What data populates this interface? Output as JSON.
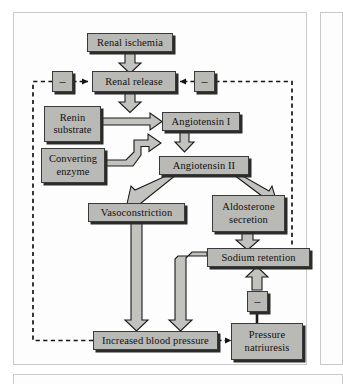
{
  "figure": {
    "type": "flowchart",
    "colors": {
      "box_fill": "#b9b9b5",
      "box_border": "#3a3a3a",
      "box_shadow": "#2b2b2b",
      "arrow_fill": "#c2c2be",
      "arrow_outline": "#1b1b1b",
      "dashed_line": "#141414",
      "panel_border": "#c9c9c9",
      "page_background": "#ffffff"
    }
  },
  "nodes": [
    {
      "id": "renal_ischemia",
      "label": "Renal ischemia"
    },
    {
      "id": "minus_left",
      "label": "–"
    },
    {
      "id": "renal_release",
      "label": "Renal release"
    },
    {
      "id": "minus_right",
      "label": "–"
    },
    {
      "id": "renin_substrate",
      "label_line1": "Renin",
      "label_line2": "substrate"
    },
    {
      "id": "angiotensin_i",
      "label": "Angiotensin I"
    },
    {
      "id": "converting_enzyme",
      "label_line1": "Converting",
      "label_line2": "enzyme"
    },
    {
      "id": "angiotensin_ii",
      "label": "Angiotensin II"
    },
    {
      "id": "vasoconstriction",
      "label": "Vasoconstriction"
    },
    {
      "id": "aldosterone",
      "label_line1": "Aldosterone",
      "label_line2": "secretion"
    },
    {
      "id": "sodium_retention",
      "label": "Sodium retention"
    },
    {
      "id": "minus_bottom",
      "label": "–"
    },
    {
      "id": "increased_bp",
      "label": "Increased blood pressure"
    },
    {
      "id": "pressure_natriuresis",
      "label_line1": "Pressure",
      "label_line2": "natriuresis"
    }
  ],
  "edges": [
    {
      "from": "renal_ischemia",
      "to": "renal_release",
      "style": "block-arrow"
    },
    {
      "from": "minus_left",
      "to": "renal_release",
      "style": "dashed-arrow"
    },
    {
      "from": "minus_right",
      "to": "renal_release",
      "style": "dashed-arrow"
    },
    {
      "from": "renal_release",
      "to": "angiotensin_i",
      "style": "block-arrow"
    },
    {
      "from": "renin_substrate",
      "to": "angiotensin_i",
      "style": "block-arrow"
    },
    {
      "from": "converting_enzyme",
      "to": "angiotensin_ii",
      "style": "block-arrow"
    },
    {
      "from": "angiotensin_i",
      "to": "angiotensin_ii",
      "style": "block-arrow"
    },
    {
      "from": "angiotensin_ii",
      "to": "vasoconstriction",
      "style": "block-arrow"
    },
    {
      "from": "angiotensin_ii",
      "to": "aldosterone",
      "style": "block-arrow"
    },
    {
      "from": "aldosterone",
      "to": "sodium_retention",
      "style": "block-arrow"
    },
    {
      "from": "vasoconstriction",
      "to": "increased_bp",
      "style": "block-arrow"
    },
    {
      "from": "sodium_retention",
      "to": "increased_bp",
      "style": "block-arrow"
    },
    {
      "from": "increased_bp",
      "to": "pressure_natriuresis",
      "style": "dashed-arrow"
    },
    {
      "from": "pressure_natriuresis",
      "to": "minus_bottom",
      "style": "solid-line"
    },
    {
      "from": "minus_bottom",
      "to": "sodium_retention",
      "style": "block-arrow"
    },
    {
      "from": "increased_bp",
      "to": "minus_left",
      "style": "dashed-feedback-left"
    },
    {
      "from": "sodium_retention",
      "to": "minus_right",
      "style": "dashed-feedback-right"
    }
  ]
}
